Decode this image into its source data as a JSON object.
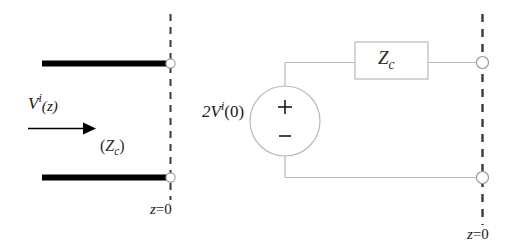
{
  "figure": {
    "background_color": "#ffffff",
    "width": 522,
    "height": 252
  },
  "left_panel": {
    "name": "transmission-line-diagram",
    "incident_wave_label": {
      "base": "V",
      "superscript": "i",
      "argument": "(z)",
      "full_text": "V i(z)"
    },
    "characteristic_impedance_label": {
      "open_paren": "(",
      "base": "Z",
      "subscript": "c",
      "close_paren": ")",
      "full_text": "(Zc)"
    },
    "reference_plane_label": {
      "base": "z",
      "equals": "=",
      "value": "0",
      "full_text": "z=0"
    },
    "arrow": {
      "name": "propagation-direction-arrow",
      "direction": "right"
    },
    "conductors": [
      {
        "name": "upper-conductor",
        "color": "#000000"
      },
      {
        "name": "lower-conductor",
        "color": "#000000"
      }
    ],
    "terminals": [
      {
        "name": "upper-terminal-node"
      },
      {
        "name": "lower-terminal-node"
      }
    ]
  },
  "right_panel": {
    "name": "equivalent-circuit-diagram",
    "source_label": {
      "coefficient": "2",
      "base": "V",
      "superscript": "i",
      "argument": "(0)",
      "full_text": "2V i(0)"
    },
    "source_polarity": {
      "positive": "+",
      "negative": "–"
    },
    "impedance_box_label": {
      "base": "Z",
      "subscript": "c",
      "full_text": "Zc"
    },
    "reference_plane_label": {
      "base": "z",
      "equals": "=",
      "value": "0",
      "full_text": "z=0"
    },
    "terminals": [
      {
        "name": "upper-terminal-node"
      },
      {
        "name": "lower-terminal-node"
      }
    ]
  },
  "style": {
    "wire_color": "#b9b9b9",
    "dash_color": "#3a3a3a",
    "conductor_color": "#000000",
    "text_color": "#1a1a1a"
  }
}
